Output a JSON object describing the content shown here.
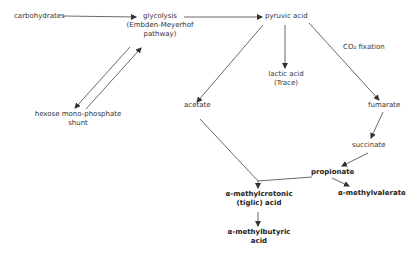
{
  "diagram": {
    "nodes": {
      "carbohydrates": "carbohydrates",
      "glycolysis_1": "glycolysis",
      "glycolysis_2": "(Embden-Meyerhof",
      "glycolysis_3": "pathway)",
      "hmp_1": "hexose mono-phosphate",
      "hmp_2": "shunt",
      "pyruvic": "pyruvic acid",
      "lactic_1": "lactic acid",
      "lactic_2": "(Trace)",
      "co2": "CO₂ fixation",
      "acetate": "acetate",
      "fumarate": "fumarate",
      "succinate": "succinate",
      "propionate": "propionate",
      "methylvalerate": "α-methylvalerate",
      "tiglic_1": "α-methylcrotonic",
      "tiglic_2": "(tiglic) acid",
      "butyric_1": "α-methylbutyric",
      "butyric_2": "acid"
    },
    "edges": [
      {
        "from": "carbohydrates",
        "to": "glycolysis"
      },
      {
        "from": "glycolysis",
        "to": "pyruvic acid"
      },
      {
        "from": "glycolysis",
        "to": "hexose mono-phosphate shunt"
      },
      {
        "from": "hexose mono-phosphate shunt",
        "to": "glycolysis"
      },
      {
        "from": "pyruvic acid",
        "to": "lactic acid"
      },
      {
        "from": "pyruvic acid",
        "to": "acetate"
      },
      {
        "from": "pyruvic acid",
        "to": "fumarate",
        "label": "CO₂ fixation"
      },
      {
        "from": "fumarate",
        "to": "succinate"
      },
      {
        "from": "succinate",
        "to": "propionate"
      },
      {
        "from": "propionate",
        "to": "α-methylvalerate"
      },
      {
        "from": "acetate",
        "to": "α-methylcrotonic (tiglic) acid"
      },
      {
        "from": "propionate",
        "to": "α-methylcrotonic (tiglic) acid"
      },
      {
        "from": "α-methylcrotonic (tiglic) acid",
        "to": "α-methylbutyric acid"
      }
    ]
  }
}
